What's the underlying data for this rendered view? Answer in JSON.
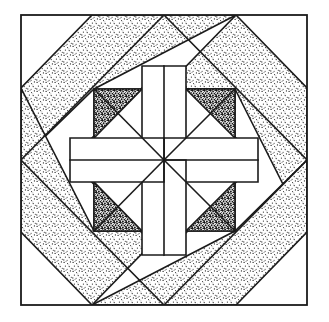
{
  "figure": {
    "title": "Quilt Block Pattern",
    "canvas_width": 329,
    "canvas_height": 322,
    "background_color": "#ffffff",
    "line_color": "#1b1b1b",
    "line_width": 1.6
  },
  "palette": {
    "plain": "#ffffff",
    "light_stipple_base": "#ffffff",
    "light_stipple_dot": "#1b1b1b",
    "dark_stipple_base": "#ffffff",
    "dark_stipple_dot": "#111111",
    "outline": "#1b1b1b"
  },
  "geometry": {
    "outer_square": {
      "left": 21,
      "top": 15,
      "right": 307,
      "bottom": 305
    },
    "center": {
      "x": 164,
      "y": 160
    },
    "edge_midpoints": {
      "top": {
        "x": 164,
        "y": 15
      },
      "right": {
        "x": 307,
        "y": 160
      },
      "bottom": {
        "x": 164,
        "y": 305
      },
      "left": {
        "x": 21,
        "y": 160
      }
    },
    "quarter_points": {
      "top_left_on_left_edge": {
        "x": 21,
        "y": 88
      },
      "bottom_left_on_left_edge": {
        "x": 21,
        "y": 232
      },
      "top_left_on_top_edge": {
        "x": 92,
        "y": 15
      },
      "top_right_on_top_edge": {
        "x": 236,
        "y": 15
      },
      "top_right_on_right_edge": {
        "x": 307,
        "y": 88
      },
      "bottom_right_on_right_edge": {
        "x": 307,
        "y": 232
      },
      "bottom_right_on_bottom_edge": {
        "x": 236,
        "y": 305
      },
      "bottom_left_on_bottom_edge": {
        "x": 92,
        "y": 305
      }
    },
    "inner_square": {
      "left": 94,
      "top": 89,
      "right": 235,
      "bottom": 231
    },
    "inner_diamond_vertices": [
      {
        "x": 164,
        "y": 66
      },
      {
        "x": 258,
        "y": 160
      },
      {
        "x": 164,
        "y": 255
      },
      {
        "x": 70,
        "y": 160
      }
    ],
    "star_arm_half_width": 22
  },
  "elements": {
    "outer_border": {
      "name": "Outer square border",
      "fill": "plain"
    },
    "pinwheel_bands": {
      "name": "Pinwheel of four light-stippled diagonal bands",
      "count": 4,
      "fill": "light_stipple",
      "rotation_symmetry_deg": 90
    },
    "corner_triangles": {
      "name": "Plain background corner triangles",
      "count": 8,
      "fill": "plain"
    },
    "on_point_diamond": {
      "name": "On-point diamond frame touching edge midpoints",
      "fill": "plain"
    },
    "inner_square_frame": {
      "name": "Central square frame",
      "fill": "plain"
    },
    "star_points": {
      "name": "Four-point star arms radiating from center",
      "count": 4,
      "fill": "plain"
    },
    "dark_corner_triangles": {
      "name": "Dark-stippled triangles in inner square corners",
      "count": 4,
      "fill": "dark_stipple"
    },
    "center_radials": {
      "name": "Eight radial lines meeting at block center",
      "count": 8
    }
  }
}
